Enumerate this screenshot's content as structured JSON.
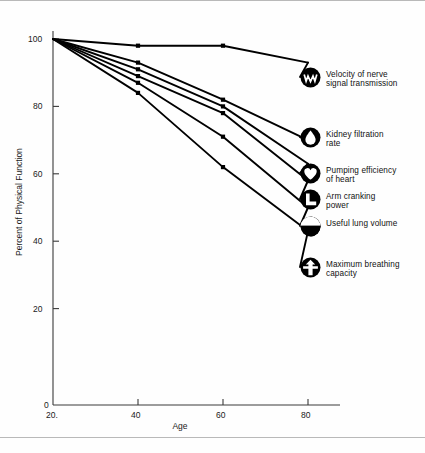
{
  "chart_data": {
    "type": "line",
    "title": "",
    "xlabel": "Age",
    "ylabel": "Percent of Physical Function",
    "xlim": [
      20,
      80
    ],
    "ylim": [
      0,
      100
    ],
    "xticks": [
      20,
      40,
      60,
      80
    ],
    "xticklabels": [
      "20",
      "40",
      "60",
      "80"
    ],
    "yticks": [
      0,
      20,
      40,
      60,
      80,
      100
    ],
    "yticklabels": [
      "0",
      "20",
      "40",
      "60",
      "80",
      "100"
    ],
    "grid": false,
    "legend_position": "right-outside",
    "x": [
      20,
      40,
      60,
      80
    ],
    "series": [
      {
        "name": "Velocity of nerve signal transmission",
        "label": "Velocity of nerve\nsignal transmission",
        "icon": "nerve-waveform-icon",
        "values": [
          100,
          98,
          98,
          93
        ]
      },
      {
        "name": "Kidney filtration rate",
        "label": "Kidney filtration\nrate",
        "icon": "kidney-droplet-icon",
        "values": [
          100,
          93,
          82,
          70
        ]
      },
      {
        "name": "Pumping efficiency of heart",
        "label": "Pumping efficiency\nof heart",
        "icon": "heart-icon",
        "values": [
          100,
          91,
          80,
          63
        ]
      },
      {
        "name": "Arm cranking power",
        "label": "Arm cranking\npower",
        "icon": "arm-crank-icon",
        "values": [
          100,
          89,
          78,
          58
        ]
      },
      {
        "name": "Useful lung volume",
        "label": "Useful lung volume",
        "icon": "lung-volume-icon",
        "values": [
          100,
          87,
          71,
          50
        ]
      },
      {
        "name": "Maximum breathing capacity",
        "label": "Maximum breathing\ncapacity",
        "icon": "breathing-capacity-icon",
        "values": [
          100,
          84,
          62,
          43
        ]
      }
    ]
  },
  "colors": {
    "line": "#000000",
    "axis": "#3a3a3a",
    "text": "#111111",
    "background": "#ffffff",
    "frame_border": "#b9b9b9"
  }
}
